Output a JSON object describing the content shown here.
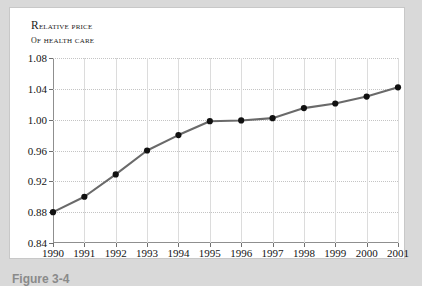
{
  "figure": {
    "caption": "Figure 3-4",
    "panel_background": "#ffffff",
    "page_background": "#d9d9d9"
  },
  "chart_data": {
    "type": "line",
    "title": "RELATIVE PRICE OF HEALTH CARE",
    "title_line1": "Relative price",
    "title_line2": "of health care",
    "xlabel": "",
    "ylabel": "",
    "categories": [
      "1990",
      "1991",
      "1992",
      "1993",
      "1994",
      "1995",
      "1996",
      "1997",
      "1998",
      "1999",
      "2000",
      "2001"
    ],
    "values": [
      0.88,
      0.9,
      0.929,
      0.96,
      0.98,
      0.998,
      0.999,
      1.002,
      1.015,
      1.021,
      1.03,
      1.042
    ],
    "ylim": [
      0.84,
      1.08
    ],
    "yticks": [
      "0.84",
      "0.88",
      "0.92",
      "0.96",
      "1.00",
      "1.04",
      "1.08"
    ],
    "ytick_values": [
      0.84,
      0.88,
      0.92,
      0.96,
      1.0,
      1.04,
      1.08
    ],
    "xticks": [
      "1990",
      "1991",
      "1992",
      "1993",
      "1994",
      "1995",
      "1996",
      "1997",
      "1998",
      "1999",
      "2000",
      "2001"
    ],
    "grid": true,
    "grid_horizontal_style": "dotted",
    "grid_vertical_style": "solid",
    "legend": null,
    "line_color": "#6a6a6a",
    "marker_color": "#111111",
    "marker_shape": "circle",
    "axis_color": "#8f8f8f",
    "grid_color": "#c8c8c8"
  }
}
